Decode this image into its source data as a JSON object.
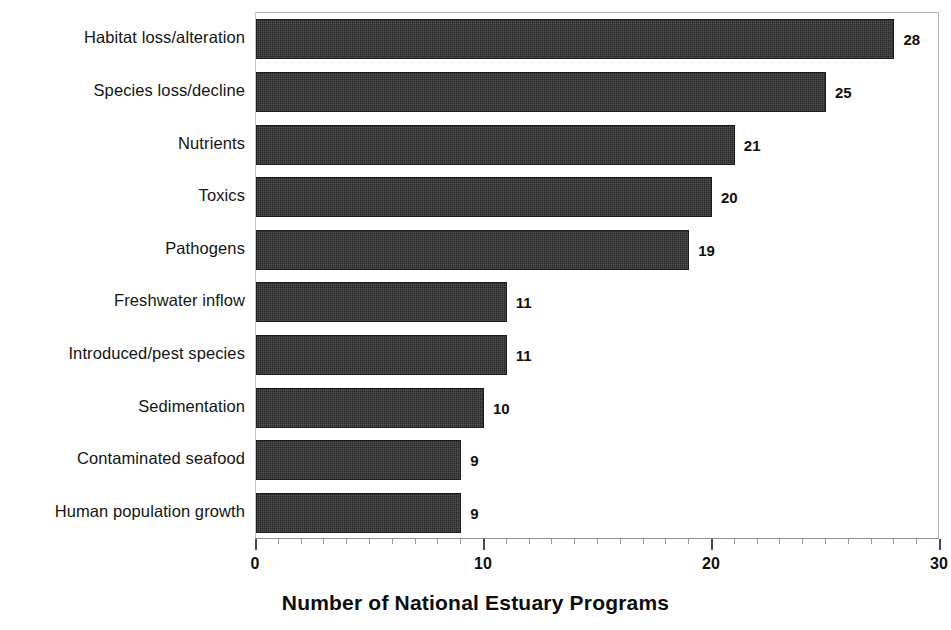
{
  "chart_data": {
    "type": "bar",
    "orientation": "horizontal",
    "title": "",
    "xlabel": "Number of National Estuary Programs",
    "ylabel": "",
    "xlim": [
      0,
      30
    ],
    "xticks": [
      0,
      10,
      20,
      30
    ],
    "xtick_labels": [
      "0",
      "10",
      "20",
      "30"
    ],
    "minor_tick_interval": 1,
    "grid": false,
    "legend": null,
    "bar_color": "#262626",
    "categories": [
      "Habitat loss/alteration",
      "Species loss/decline",
      "Nutrients",
      "Toxics",
      "Pathogens",
      "Freshwater inflow",
      "Introduced/pest species",
      "Sedimentation",
      "Contaminated seafood",
      "Human population growth"
    ],
    "values": [
      28,
      25,
      21,
      20,
      19,
      11,
      11,
      10,
      9,
      9
    ],
    "value_labels": [
      "28",
      "25",
      "21",
      "20",
      "19",
      "11",
      "11",
      "10",
      "9",
      "9"
    ]
  }
}
